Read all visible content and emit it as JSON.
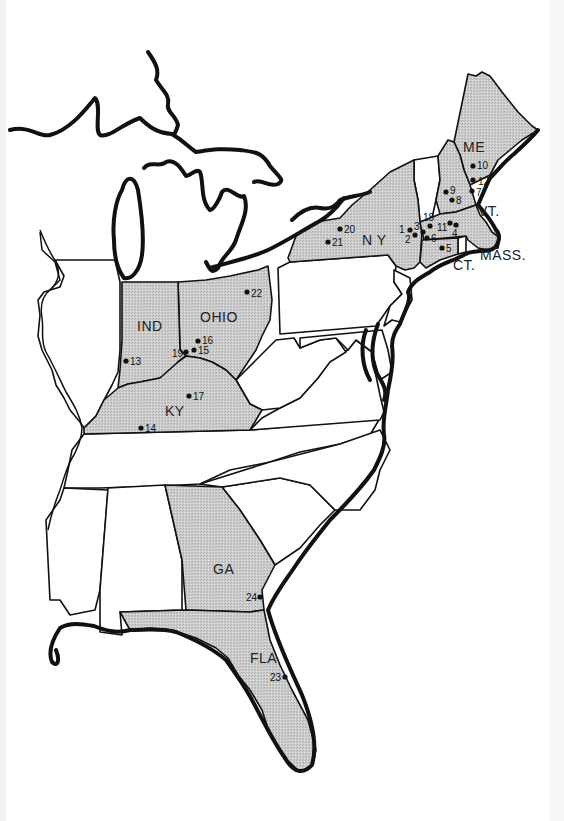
{
  "map": {
    "title": "Eastern United States locations map",
    "colors": {
      "shaded_fill": "#c8c8c8",
      "outline": "#111111",
      "background": "#ffffff"
    },
    "shaded_states": [
      "ME",
      "NH",
      "MASS.",
      "CT.",
      "N Y",
      "OHIO",
      "IND",
      "KY",
      "GA",
      "FLA"
    ],
    "state_labels": [
      {
        "id": "me",
        "text": "ME",
        "x": 463,
        "y": 152
      },
      {
        "id": "vt",
        "text": "VT.",
        "x": 478,
        "y": 216
      },
      {
        "id": "ny",
        "text": "N Y",
        "x": 362,
        "y": 245
      },
      {
        "id": "mass",
        "text": "MASS.",
        "x": 480,
        "y": 260
      },
      {
        "id": "ct",
        "text": "CT.",
        "x": 453,
        "y": 270
      },
      {
        "id": "ind",
        "text": "IND",
        "x": 137,
        "y": 331
      },
      {
        "id": "ohio",
        "text": "OHIO",
        "x": 200,
        "y": 322
      },
      {
        "id": "ky",
        "text": "KY",
        "x": 165,
        "y": 416
      },
      {
        "id": "ga",
        "text": "GA",
        "x": 213,
        "y": 574
      },
      {
        "id": "fla",
        "text": "FLA",
        "x": 250,
        "y": 663
      }
    ],
    "points": [
      {
        "n": "1",
        "x": 405,
        "y": 229,
        "label_side": "left"
      },
      {
        "n": "2",
        "x": 413,
        "y": 235,
        "label_side": "left"
      },
      {
        "n": "3",
        "x": 423,
        "y": 229,
        "label_side": "left"
      },
      {
        "n": "4",
        "x": 456,
        "y": 226,
        "label_side": "below"
      },
      {
        "n": "5",
        "x": 442,
        "y": 248,
        "label_side": "right"
      },
      {
        "n": "6",
        "x": 426,
        "y": 238,
        "label_side": "right"
      },
      {
        "n": "7",
        "x": 471,
        "y": 191,
        "label_side": "right"
      },
      {
        "n": "8",
        "x": 452,
        "y": 200,
        "label_side": "right"
      },
      {
        "n": "9",
        "x": 445,
        "y": 191,
        "label_side": "right"
      },
      {
        "n": "10",
        "x": 472,
        "y": 166,
        "label_side": "right"
      },
      {
        "n": "11",
        "x": 448,
        "y": 222,
        "label_side": "left"
      },
      {
        "n": "12",
        "x": 473,
        "y": 179,
        "label_side": "right"
      },
      {
        "n": "13",
        "x": 125,
        "y": 361,
        "label_side": "right"
      },
      {
        "n": "14",
        "x": 141,
        "y": 429,
        "label_side": "right"
      },
      {
        "n": "15",
        "x": 193,
        "y": 350,
        "label_side": "right"
      },
      {
        "n": "16",
        "x": 197,
        "y": 341,
        "label_side": "right"
      },
      {
        "n": "17",
        "x": 188,
        "y": 396,
        "label_side": "right"
      },
      {
        "n": "18",
        "x": 430,
        "y": 223,
        "label_side": "above"
      },
      {
        "n": "19",
        "x": 186,
        "y": 353,
        "label_side": "left"
      },
      {
        "n": "20",
        "x": 340,
        "y": 229,
        "label_side": "right"
      },
      {
        "n": "21",
        "x": 328,
        "y": 242,
        "label_side": "right"
      },
      {
        "n": "22",
        "x": 247,
        "y": 292,
        "label_side": "right"
      },
      {
        "n": "23",
        "x": 285,
        "y": 677,
        "label_side": "left"
      },
      {
        "n": "24",
        "x": 260,
        "y": 597,
        "label_side": "left"
      }
    ]
  }
}
